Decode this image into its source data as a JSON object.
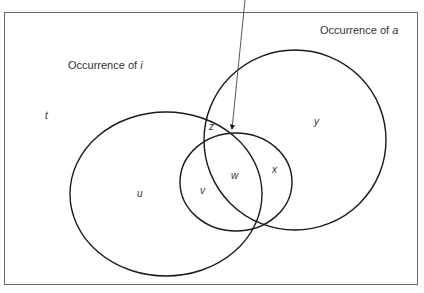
{
  "diagram": {
    "type": "venn",
    "sets": [
      {
        "id": "i",
        "label_prefix": "Occurrence of ",
        "label_var": "i"
      },
      {
        "id": "a",
        "label_prefix": "Occurrence of ",
        "label_var": "a"
      },
      {
        "id": "inner",
        "label": ""
      }
    ],
    "regions": {
      "t": "t",
      "u": "u",
      "v": "v",
      "w": "w",
      "x": "x",
      "y": "y",
      "z": "z"
    },
    "arrow": {
      "points_to": "intersection point of circles (upper)"
    },
    "colors": {
      "stroke": "#1a1a1a",
      "frame": "#6a6a6a",
      "text": "#333333"
    }
  }
}
